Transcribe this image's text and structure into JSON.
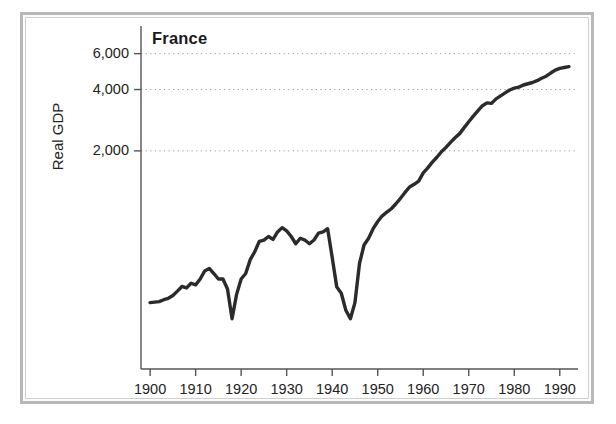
{
  "figure": {
    "title": "France",
    "ylabel": "Real GDP",
    "frame_color": "#b8b8b8",
    "line_color": "#2b2b2b",
    "grid_color": "#9a9a9a",
    "axis_color": "#555555",
    "background": "#ffffff"
  },
  "axes": {
    "y_ticks": [
      {
        "value": 2000,
        "label": "2,000"
      },
      {
        "value": 4000,
        "label": "4,000"
      },
      {
        "value": 6000,
        "label": "6,000"
      }
    ],
    "x_ticks": [
      {
        "value": 1900,
        "label": "1900"
      },
      {
        "value": 1910,
        "label": "1910"
      },
      {
        "value": 1920,
        "label": "1920"
      },
      {
        "value": 1930,
        "label": "1930"
      },
      {
        "value": 1940,
        "label": "1940"
      },
      {
        "value": 1950,
        "label": "1950"
      },
      {
        "value": 1960,
        "label": "1960"
      },
      {
        "value": 1970,
        "label": "1970"
      },
      {
        "value": 1980,
        "label": "1980"
      },
      {
        "value": 1990,
        "label": "1990"
      }
    ]
  },
  "chart_data": {
    "type": "line",
    "title": "France",
    "xlabel": "",
    "ylabel": "Real GDP",
    "yscale": "log",
    "xlim": [
      1898,
      1994
    ],
    "ylim": [
      170,
      8200
    ],
    "grid": true,
    "gridlines_y": [
      2000,
      4000,
      6000
    ],
    "legend": "none",
    "series": [
      {
        "name": "France Real GDP",
        "color": "#2b2b2b",
        "x": [
          1900,
          1901,
          1902,
          1903,
          1904,
          1905,
          1906,
          1907,
          1908,
          1909,
          1910,
          1911,
          1912,
          1913,
          1914,
          1915,
          1916,
          1917,
          1918,
          1919,
          1920,
          1921,
          1922,
          1923,
          1924,
          1925,
          1926,
          1927,
          1928,
          1929,
          1930,
          1931,
          1932,
          1933,
          1934,
          1935,
          1936,
          1937,
          1938,
          1939,
          1940,
          1941,
          1942,
          1943,
          1944,
          1945,
          1946,
          1947,
          1948,
          1949,
          1950,
          1951,
          1952,
          1953,
          1954,
          1955,
          1956,
          1957,
          1958,
          1959,
          1960,
          1961,
          1962,
          1963,
          1964,
          1965,
          1966,
          1967,
          1968,
          1969,
          1970,
          1971,
          1972,
          1973,
          1974,
          1975,
          1976,
          1977,
          1978,
          1979,
          1980,
          1981,
          1982,
          1983,
          1984,
          1985,
          1986,
          1987,
          1988,
          1989,
          1990,
          1991,
          1992
        ],
        "y": [
          360,
          362,
          364,
          372,
          378,
          390,
          410,
          432,
          425,
          448,
          440,
          470,
          515,
          530,
          500,
          470,
          470,
          420,
          300,
          395,
          470,
          500,
          585,
          640,
          720,
          730,
          760,
          735,
          800,
          840,
          810,
          760,
          700,
          745,
          730,
          700,
          730,
          790,
          800,
          830,
          600,
          430,
          400,
          330,
          300,
          360,
          560,
          690,
          745,
          830,
          900,
          960,
          1000,
          1040,
          1100,
          1170,
          1250,
          1330,
          1370,
          1420,
          1560,
          1650,
          1760,
          1860,
          1980,
          2080,
          2200,
          2320,
          2430,
          2600,
          2780,
          2960,
          3140,
          3330,
          3440,
          3420,
          3600,
          3720,
          3850,
          3980,
          4060,
          4110,
          4210,
          4270,
          4330,
          4420,
          4540,
          4650,
          4820,
          4980,
          5080,
          5130,
          5180
        ]
      }
    ]
  }
}
